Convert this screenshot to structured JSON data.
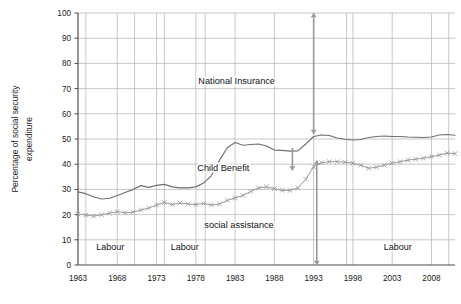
{
  "chart_data": {
    "type": "line",
    "title": "",
    "subtitle": "",
    "xlabel": "",
    "ylabel": "Percentage of social security expenditure",
    "xlim": [
      1963,
      2011
    ],
    "ylim": [
      0,
      100
    ],
    "grid": true,
    "legend_position": "none",
    "xticks": [
      "1963",
      "1968",
      "1973",
      "1978",
      "1983",
      "1988",
      "1993",
      "1998",
      "2003",
      "2008"
    ],
    "yticks": [
      "0",
      "10",
      "20",
      "30",
      "40",
      "50",
      "60",
      "70",
      "80",
      "90",
      "100"
    ],
    "x": [
      1963,
      1964,
      1965,
      1966,
      1967,
      1968,
      1969,
      1970,
      1971,
      1972,
      1973,
      1974,
      1975,
      1976,
      1977,
      1978,
      1979,
      1980,
      1981,
      1982,
      1983,
      1984,
      1985,
      1986,
      1987,
      1988,
      1989,
      1990,
      1991,
      1992,
      1993,
      1994,
      1995,
      1996,
      1997,
      1998,
      1999,
      2000,
      2001,
      2002,
      2003,
      2004,
      2005,
      2006,
      2007,
      2008,
      2009,
      2010,
      2011
    ],
    "series": [
      {
        "name": "upper-cumulative-line",
        "marker": "none",
        "color": "#6f6f6f",
        "values": [
          29.0,
          28.3,
          27.0,
          26.2,
          26.5,
          27.6,
          28.8,
          30.0,
          31.5,
          30.8,
          31.6,
          32.0,
          31.0,
          30.6,
          30.6,
          31.0,
          32.5,
          35.5,
          41.5,
          46.5,
          48.6,
          47.5,
          47.8,
          48.0,
          47.2,
          45.6,
          45.5,
          45.2,
          45.3,
          48.0,
          51.0,
          51.6,
          51.4,
          50.4,
          49.9,
          49.6,
          49.8,
          50.6,
          51.0,
          51.2,
          51.0,
          51.0,
          50.8,
          50.7,
          50.6,
          50.8,
          51.6,
          51.8,
          51.5
        ]
      },
      {
        "name": "lower-cumulative-line",
        "marker": "x",
        "color": "#9a9a9a",
        "values": [
          20.3,
          19.8,
          19.4,
          19.9,
          20.6,
          21.2,
          20.7,
          21.0,
          21.8,
          22.6,
          23.8,
          24.8,
          24.0,
          24.6,
          24.2,
          24.0,
          24.4,
          23.8,
          24.2,
          25.6,
          26.6,
          27.6,
          29.2,
          30.6,
          31.0,
          30.3,
          29.6,
          29.6,
          30.6,
          34.0,
          39.0,
          40.6,
          41.0,
          41.0,
          40.8,
          40.4,
          39.6,
          38.4,
          38.8,
          39.6,
          40.4,
          41.0,
          41.6,
          42.0,
          42.4,
          43.0,
          43.6,
          44.4,
          44.2
        ]
      }
    ],
    "annotations": [
      {
        "id": "national-insurance",
        "label": "National Insurance",
        "x": 1983.2,
        "y": 73
      },
      {
        "id": "child-benefit",
        "label": "Child Benefit",
        "x": 1981.5,
        "y": 38.5
      },
      {
        "id": "social-assistance",
        "label": "social assistance",
        "x": 1983.5,
        "y": 16
      }
    ],
    "arrows": [
      {
        "id": "national-insurance-arrow",
        "x": 1993.0,
        "y_from": 100,
        "y_to": 52,
        "heads": "both",
        "color": "#9a9a9a"
      },
      {
        "id": "child-benefit-arrow",
        "x": 1990.3,
        "y_from": 46.5,
        "y_to": 37.5,
        "heads": "end",
        "color": "#9a9a9a"
      },
      {
        "id": "social-assistance-arrow",
        "x": 1993.4,
        "y_from": 41.5,
        "y_to": 0,
        "heads": "both",
        "color": "#9a9a9a"
      }
    ],
    "period_bands": [
      {
        "id": "labour-1",
        "label": "Labour",
        "x_start": 1964.0,
        "x_end": 1970.2,
        "y": 7
      },
      {
        "id": "labour-2",
        "label": "Labour",
        "x_start": 1974.0,
        "x_end": 1979.2,
        "y": 7
      },
      {
        "id": "labour-3",
        "label": "Labour",
        "x_start": 1997.2,
        "x_end": 2010.2,
        "y": 7
      }
    ],
    "period_dividers": [
      1964.0,
      1970.2,
      1974.0,
      1979.2,
      1997.2,
      2010.2
    ]
  },
  "colors": {
    "grid": "#b9b9b9",
    "axis": "#4a4a4a",
    "upper_series": "#6f6f6f",
    "lower_series": "#9a9a9a",
    "arrow": "#9a9a9a",
    "text": "#111111",
    "background": "#ffffff"
  }
}
